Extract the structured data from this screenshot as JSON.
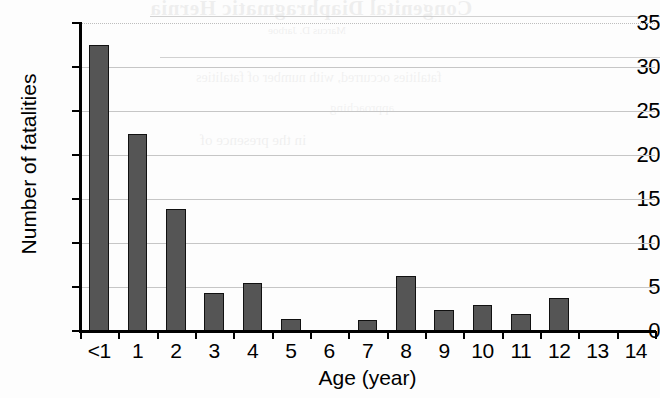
{
  "chart_data": {
    "type": "bar",
    "title": "",
    "subtitle": "",
    "xlabel": "Age (year)",
    "ylabel": "Number of fatalities",
    "categories": [
      "<1",
      "1",
      "2",
      "3",
      "4",
      "5",
      "6",
      "7",
      "8",
      "9",
      "10",
      "11",
      "12",
      "13",
      "14"
    ],
    "values": [
      32.5,
      22.4,
      13.9,
      4.3,
      5.5,
      1.4,
      0,
      1.3,
      6.3,
      2.4,
      2.9,
      1.9,
      3.7,
      0,
      0
    ],
    "series": [
      {
        "name": "Number of fatalities",
        "values": [
          32.5,
          22.4,
          13.9,
          4.3,
          5.5,
          1.4,
          0,
          1.3,
          6.3,
          2.4,
          2.9,
          1.9,
          3.7,
          0,
          0
        ]
      }
    ],
    "ylim": [
      0,
      35
    ],
    "xlim_categories": 15,
    "y_ticks": [
      0,
      5,
      10,
      15,
      20,
      25,
      30,
      35
    ],
    "y_tick_labels": [
      "0",
      "5",
      "10",
      "15",
      "20",
      "25",
      "30",
      "35"
    ],
    "grid": "horizontal",
    "legend": "none",
    "bar_color": "#555555",
    "bar_edge_color": "#111111",
    "gridline_color": "#c6c6c6",
    "axis_color": "#000000",
    "background_color": "#ffffff",
    "annotations": []
  },
  "ghost_text": {
    "line1": "Congenital Diaphragmatic Hernia",
    "line2": "Marcus D. Jarboe",
    "line3": "fatalities occurred, with number of fatalities",
    "line4": "approaching",
    "line5": "in the presence of",
    "line6": "age groups",
    "line7": "the risk"
  }
}
